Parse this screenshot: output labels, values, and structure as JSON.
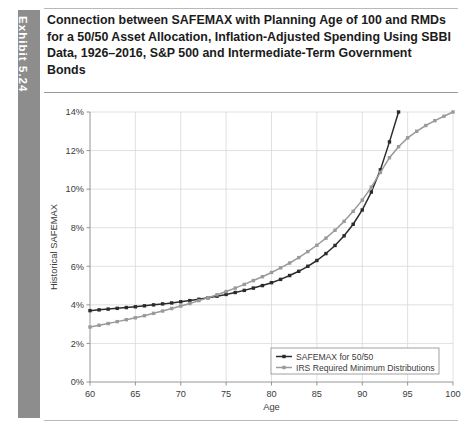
{
  "exhibit": {
    "tab_label": "Exhibit 5.24"
  },
  "title": "Connection between SAFEMAX with Planning Age of 100 and RMDs for a 50/50 Asset Allocation, Inflation-Adjusted Spending Using SBBI Data, 1926–2016, S&P 500 and Intermediate-Term Government Bonds",
  "colors": {
    "safemax_line": "#2b2b2b",
    "rmd_line": "#9a9a9a",
    "gridline": "#d8d8d8",
    "axis": "#8a8a8a",
    "tab_background": "#8d8d8d",
    "rule": "#b9b9b9",
    "title_text": "#1b1b1b"
  },
  "chart_data": {
    "type": "line",
    "title": "",
    "xlabel": "Age",
    "ylabel": "Historical SAFEMAX",
    "xlim": [
      60,
      100
    ],
    "ylim": [
      0,
      14
    ],
    "xticks": [
      60,
      65,
      70,
      75,
      80,
      85,
      90,
      95,
      100
    ],
    "xtick_labels": [
      "60",
      "65",
      "70",
      "75",
      "80",
      "85",
      "90",
      "95",
      "100"
    ],
    "yticks": [
      0,
      2,
      4,
      6,
      8,
      10,
      12,
      14
    ],
    "ytick_labels": [
      "0%",
      "2%",
      "4%",
      "6%",
      "8%",
      "10%",
      "12%",
      "14%"
    ],
    "grid": true,
    "legend_position": "bottom-right",
    "value_unit": "percent",
    "x": [
      60,
      61,
      62,
      63,
      64,
      65,
      66,
      67,
      68,
      69,
      70,
      71,
      72,
      73,
      74,
      75,
      76,
      77,
      78,
      79,
      80,
      81,
      82,
      83,
      84,
      85,
      86,
      87,
      88,
      89,
      90,
      91,
      92,
      93,
      94,
      95,
      96,
      97,
      98,
      99,
      100
    ],
    "series": [
      {
        "name": "SAFEMAX for 50/50",
        "color": "#2b2b2b",
        "marker": "square",
        "x": [
          60,
          61,
          62,
          63,
          64,
          65,
          66,
          67,
          68,
          69,
          70,
          71,
          72,
          73,
          74,
          75,
          76,
          77,
          78,
          79,
          80,
          81,
          82,
          83,
          84,
          85,
          86,
          87,
          88,
          89,
          90,
          91,
          92,
          93,
          94
        ],
        "values": [
          3.7,
          3.74,
          3.78,
          3.82,
          3.86,
          3.9,
          3.95,
          4.0,
          4.05,
          4.1,
          4.16,
          4.22,
          4.29,
          4.37,
          4.45,
          4.54,
          4.64,
          4.75,
          4.87,
          5.0,
          5.15,
          5.32,
          5.52,
          5.74,
          6.0,
          6.3,
          6.66,
          7.08,
          7.58,
          8.18,
          8.92,
          9.85,
          11.0,
          12.45,
          14.0
        ]
      },
      {
        "name": "IRS Required Minimum Distributions",
        "color": "#9a9a9a",
        "marker": "square",
        "x": [
          60,
          61,
          62,
          63,
          64,
          65,
          66,
          67,
          68,
          69,
          70,
          71,
          72,
          73,
          74,
          75,
          76,
          77,
          78,
          79,
          80,
          81,
          82,
          83,
          84,
          85,
          86,
          87,
          88,
          89,
          90,
          91,
          92,
          93,
          94,
          95,
          96,
          97,
          98,
          99,
          100
        ],
        "values": [
          2.85,
          2.94,
          3.03,
          3.13,
          3.23,
          3.33,
          3.44,
          3.56,
          3.68,
          3.81,
          3.94,
          4.07,
          4.22,
          4.37,
          4.52,
          4.69,
          4.87,
          5.06,
          5.26,
          5.46,
          5.68,
          5.92,
          6.17,
          6.45,
          6.76,
          7.09,
          7.46,
          7.87,
          8.33,
          8.85,
          9.43,
          10.1,
          10.87,
          11.63,
          12.2,
          12.66,
          13.0,
          13.3,
          13.55,
          13.78,
          14.0
        ]
      }
    ]
  }
}
